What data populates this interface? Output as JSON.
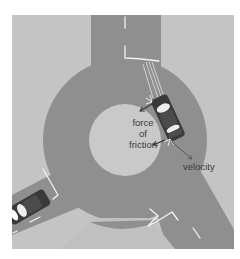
{
  "diagram": {
    "labels": {
      "friction_line1": "force",
      "friction_line2": "of",
      "friction_line3": "friction",
      "velocity": "velocity"
    },
    "colors": {
      "background": "#ffffff",
      "grass": "#c4c4c4",
      "road": "#8f8f8f",
      "island": "#c9c9c9",
      "lane_marking": "#f2f2f2",
      "car_body": "#3a3a3a",
      "car_window": "#eeeeee",
      "arrow": "#333333",
      "label_text": "#3a3a3a"
    },
    "elements": [
      {
        "name": "roundabout",
        "description": "circular road with central island"
      },
      {
        "name": "car-right",
        "description": "car driving on the ring, with friction and velocity arrows"
      },
      {
        "name": "car-left",
        "description": "car entering roundabout from bottom-left road"
      }
    ]
  }
}
